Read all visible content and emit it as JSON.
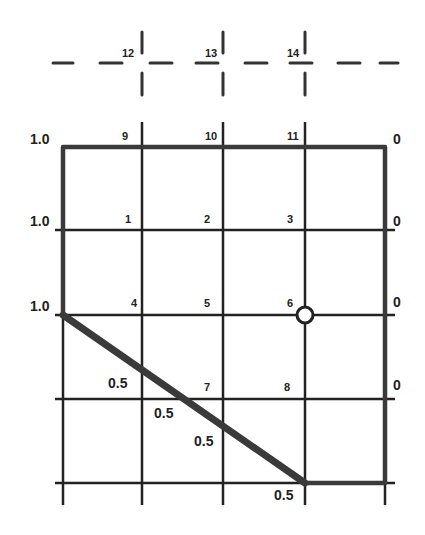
{
  "diagram": {
    "type": "finite-difference grid with boundary conditions",
    "grid": {
      "columns_x": [
        63,
        142,
        223,
        305,
        385
      ],
      "rows_y": [
        147,
        230,
        315,
        399,
        483
      ]
    },
    "ghost_nodes": [
      {
        "id": "12",
        "label": "12",
        "x": 142
      },
      {
        "id": "13",
        "label": "13",
        "x": 223
      },
      {
        "id": "14",
        "label": "14",
        "x": 305
      }
    ],
    "nodes": [
      {
        "id": "9",
        "label": "9"
      },
      {
        "id": "10",
        "label": "10"
      },
      {
        "id": "11",
        "label": "11"
      },
      {
        "id": "1",
        "label": "1"
      },
      {
        "id": "2",
        "label": "2"
      },
      {
        "id": "3",
        "label": "3"
      },
      {
        "id": "4",
        "label": "4"
      },
      {
        "id": "5",
        "label": "5"
      },
      {
        "id": "6",
        "label": "6"
      },
      {
        "id": "7",
        "label": "7"
      },
      {
        "id": "8",
        "label": "8"
      }
    ],
    "left_boundary_values": [
      "1.0",
      "1.0",
      "1.0"
    ],
    "right_boundary_values": [
      "0",
      "0",
      "0",
      "0"
    ],
    "diagonal_boundary_values": [
      "0.5",
      "0.5",
      "0.5",
      "0.5"
    ],
    "highlighted_node": "6",
    "colors": {
      "line": "#222222",
      "thick_boundary": "#3a3a3a",
      "background": "#ffffff"
    }
  }
}
